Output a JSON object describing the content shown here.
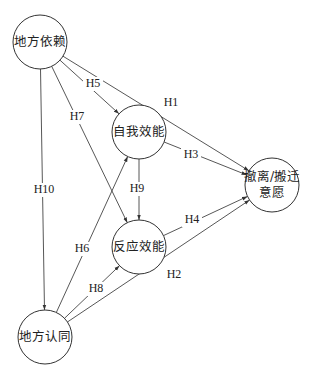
{
  "diagram": {
    "type": "path-model",
    "nodes": [
      {
        "id": "place_dependence",
        "label": "地方依赖",
        "lines": [
          "地方依赖"
        ],
        "cx": 40,
        "cy": 42,
        "r": 27
      },
      {
        "id": "self_efficacy",
        "label": "自我效能",
        "lines": [
          "自我效能"
        ],
        "cx": 139,
        "cy": 132,
        "r": 27
      },
      {
        "id": "response_efficacy",
        "label": "反应效能",
        "lines": [
          "反应效能"
        ],
        "cx": 139,
        "cy": 247,
        "r": 27
      },
      {
        "id": "relocation_intention",
        "label": "撤离/搬迁意愿",
        "lines": [
          "撤离/搬迁",
          "意愿"
        ],
        "cx": 272,
        "cy": 185,
        "r": 27
      },
      {
        "id": "place_identity",
        "label": "地方认同",
        "lines": [
          "地方认同"
        ],
        "cx": 45,
        "cy": 337,
        "r": 27
      }
    ],
    "edges": [
      {
        "label": "H1",
        "from": "place_dependence",
        "to": "relocation_intention",
        "lx": 171,
        "ly": 103
      },
      {
        "label": "H2",
        "from": "place_identity",
        "to": "relocation_intention",
        "lx": 174,
        "ly": 275
      },
      {
        "label": "H3",
        "from": "self_efficacy",
        "to": "relocation_intention",
        "lx": 191,
        "ly": 155
      },
      {
        "label": "H4",
        "from": "response_efficacy",
        "to": "relocation_intention",
        "lx": 192,
        "ly": 220
      },
      {
        "label": "H5",
        "from": "place_dependence",
        "to": "self_efficacy",
        "lx": 93,
        "ly": 84
      },
      {
        "label": "H6",
        "from": "place_identity",
        "to": "self_efficacy",
        "lx": 82,
        "ly": 249
      },
      {
        "label": "H7",
        "from": "place_dependence",
        "to": "response_efficacy",
        "lx": 77,
        "ly": 117
      },
      {
        "label": "H8",
        "from": "place_identity",
        "to": "response_efficacy",
        "lx": 96,
        "ly": 289
      },
      {
        "label": "H9",
        "from": "self_efficacy",
        "to": "response_efficacy",
        "lx": 137,
        "ly": 189
      },
      {
        "label": "H10",
        "from": "place_dependence",
        "to": "place_identity",
        "lx": 44,
        "ly": 190
      }
    ],
    "colors": {
      "stroke": "#444444",
      "text": "#222222",
      "background": "#ffffff"
    }
  }
}
